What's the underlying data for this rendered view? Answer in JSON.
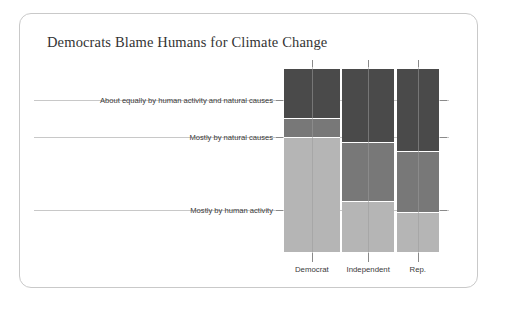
{
  "card": {
    "name": "chart-card"
  },
  "title": "Democrats Blame Humans for Climate Change",
  "chart_data": {
    "type": "bar",
    "subtype": "mosaic",
    "title": "Democrats Blame Humans for Climate Change",
    "xlabel": "",
    "ylabel": "",
    "grid": true,
    "legend": "none",
    "categories": [
      "Democrat",
      "Independent",
      "Rep."
    ],
    "column_widths_pct": [
      35.5,
      33.5,
      27.0
    ],
    "response_levels": [
      "About equally by human activity and natural causes",
      "Mostly by natural causes",
      "Mostly by human activity"
    ],
    "series": [
      {
        "name": "About equally by human activity and natural causes",
        "color": "#4a4a4a",
        "values": [
          27,
          40,
          45
        ]
      },
      {
        "name": "Mostly by natural causes",
        "color": "#787878",
        "values": [
          10,
          32,
          33
        ]
      },
      {
        "name": "Mostly by human activity",
        "color": "#b5b5b5",
        "values": [
          63,
          28,
          22
        ]
      }
    ],
    "ylim": [
      0,
      100
    ],
    "units": "percent"
  },
  "axis": {
    "y_labels": [
      {
        "text": "About equally by human activity and natural causes",
        "pos_pct": 17
      },
      {
        "text": "Mostly by natural causes",
        "pos_pct": 37
      },
      {
        "text": "Mostly by human activity",
        "pos_pct": 77
      }
    ],
    "x_labels": [
      {
        "text": "Democrat",
        "center_pct": 17.75
      },
      {
        "text": "Independent",
        "center_pct": 53.0
      },
      {
        "text": "Rep.",
        "center_pct": 86.5
      }
    ]
  },
  "colors": {
    "dark": "#4a4a4a",
    "medium": "#787878",
    "light": "#b5b5b5",
    "card_border": "#c9c9c9",
    "grid": "#9a9a9a",
    "text": "#3a3a3a",
    "background": "#ffffff"
  }
}
